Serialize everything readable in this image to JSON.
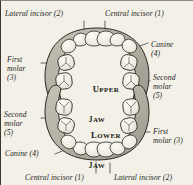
{
  "figure": {
    "background_color": "#f3f0e8",
    "ink_color": "#221f1b",
    "gum_color": "#b9b4a8",
    "tooth_color": "#efece3"
  },
  "jaws": {
    "upper": {
      "line1": "Upper",
      "line2": "jaw"
    },
    "lower": {
      "line1": "Lower",
      "line2": "jaw"
    }
  },
  "labels": {
    "top_left": {
      "text": "Lateral incisor (2)",
      "lines": [
        "Lateral incisor (2)"
      ]
    },
    "top_right": {
      "text": "Central incisor (1)",
      "lines": [
        "Central incisor (1)"
      ]
    },
    "right_canine": {
      "text": "Canine (4)",
      "lines": [
        "Canine",
        "(4)"
      ]
    },
    "right_second_molar": {
      "text": "Second molar (5)",
      "lines": [
        "Second",
        "molar",
        "(5)"
      ]
    },
    "left_first_molar": {
      "text": "First molar (3)",
      "lines": [
        "First",
        "molar",
        "(3)"
      ]
    },
    "left_second_molar": {
      "text": "Second molar (5)",
      "lines": [
        "Second",
        "molar",
        "(5)"
      ]
    },
    "left_canine": {
      "text": "Canine (4)",
      "lines": [
        "Canine (4)"
      ]
    },
    "right_first_molar": {
      "text": "First molar (3)",
      "lines": [
        "First",
        "molar (3)"
      ]
    },
    "bottom_left": {
      "text": "Central incisor (1)",
      "lines": [
        "Central incisor (1)"
      ]
    },
    "bottom_right": {
      "text": "Lateral incisor (2)",
      "lines": [
        "Lateral incisor (2)"
      ]
    }
  },
  "teeth_numbering": {
    "1": "Central incisor",
    "2": "Lateral incisor",
    "3": "First molar",
    "4": "Canine",
    "5": "Second molar"
  }
}
